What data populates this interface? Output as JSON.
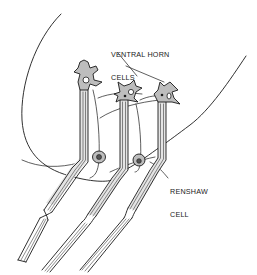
{
  "diagram": {
    "labels": {
      "ventral_horn": [
        "VENTRAL HORN",
        "CELLS"
      ],
      "renshaw": [
        "RENSHAW",
        "CELL"
      ]
    },
    "components": [
      {
        "name": "gray-matter-boundary",
        "type": "outline"
      },
      {
        "name": "ventral-horn-cell",
        "count": 3
      },
      {
        "name": "motor-axon",
        "count": 3
      },
      {
        "name": "renshaw-cell",
        "count": 2
      },
      {
        "name": "recurrent-collateral",
        "count": 3
      }
    ],
    "colors": {
      "ink": "#1a1a1a",
      "cell_fill": "#bdbdbd",
      "background": "#ffffff"
    }
  }
}
